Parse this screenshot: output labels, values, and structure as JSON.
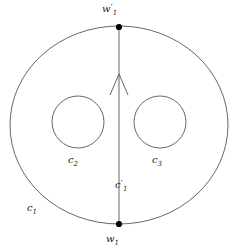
{
  "figure": {
    "background_color": "#ffffff",
    "curve_color": "#555555",
    "marker_color": "#000000",
    "label_color": "#1a1a1a"
  },
  "labels": {
    "w1_prime": {
      "base": "w",
      "prime": "′",
      "sub": "1"
    },
    "w1": {
      "base": "w",
      "prime": "",
      "sub": "1"
    },
    "c1_prime": {
      "base": "c",
      "prime": "′",
      "sub": "1"
    },
    "c1": {
      "base": "c",
      "prime": "",
      "sub": "1"
    },
    "c2": {
      "base": "c",
      "prime": "",
      "sub": "2"
    },
    "c3": {
      "base": "c",
      "prime": "",
      "sub": "3"
    }
  },
  "shapes": {
    "outer_boundary": {
      "name": "outer-ellipse",
      "cx": 119,
      "cy": 125,
      "rx": 109,
      "ry": 99
    },
    "hole_left": {
      "name": "left-hole-circle",
      "cx": 78,
      "cy": 122,
      "r": 26
    },
    "hole_right": {
      "name": "right-hole-circle",
      "cx": 160,
      "cy": 122,
      "r": 26
    },
    "arc": {
      "name": "vertical-arc",
      "x": 119,
      "y_top": 27,
      "y_bottom": 224
    },
    "arrow": {
      "name": "upward-arrowhead",
      "tip_x": 119,
      "tip_y": 74,
      "left_x": 110,
      "right_x": 128,
      "base_y": 95
    },
    "vertex_top": {
      "name": "top-vertex-dot",
      "cx": 119,
      "cy": 27,
      "r": 3.1
    },
    "vertex_bottom": {
      "name": "bottom-vertex-dot",
      "cx": 119,
      "cy": 224,
      "r": 3.1
    }
  }
}
